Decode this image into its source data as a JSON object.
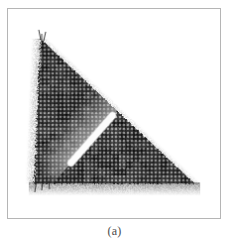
{
  "figure": {
    "caption": "(a)",
    "panel_label": "(a)",
    "frame_color": "#b5b5b5",
    "background_color": "#ffffff"
  },
  "chart_data": {
    "type": "heatmap",
    "title": "",
    "subtitle": "",
    "xlabel": "",
    "ylabel": "",
    "grid": true,
    "legend": null,
    "colors": {
      "mesh_dark": "#2b2b2b",
      "mesh_mid": "#5a5a5a",
      "mesh_light": "#9a9a9a",
      "crack_white": "#ffffff",
      "damage_gray": "#bdbdbd",
      "background": "#ffffff"
    },
    "geometry": {
      "panel_box": [
        7,
        8,
        214,
        211
      ],
      "triangle_vertices": [
        [
          40,
          38
        ],
        [
          34,
          185
        ],
        [
          196,
          185
        ]
      ],
      "crack_line": {
        "start": [
          113,
          116
        ],
        "end": [
          71,
          164
        ],
        "width_px": 4,
        "color": "#ffffff"
      },
      "damage_wedge": [
        [
          113,
          117
        ],
        [
          150,
          150
        ],
        [
          95,
          170
        ],
        [
          72,
          163
        ]
      ],
      "mesh_spacing_px": 4,
      "mesh_rows": 37,
      "mesh_cols": 40
    },
    "categories": [],
    "values": []
  }
}
